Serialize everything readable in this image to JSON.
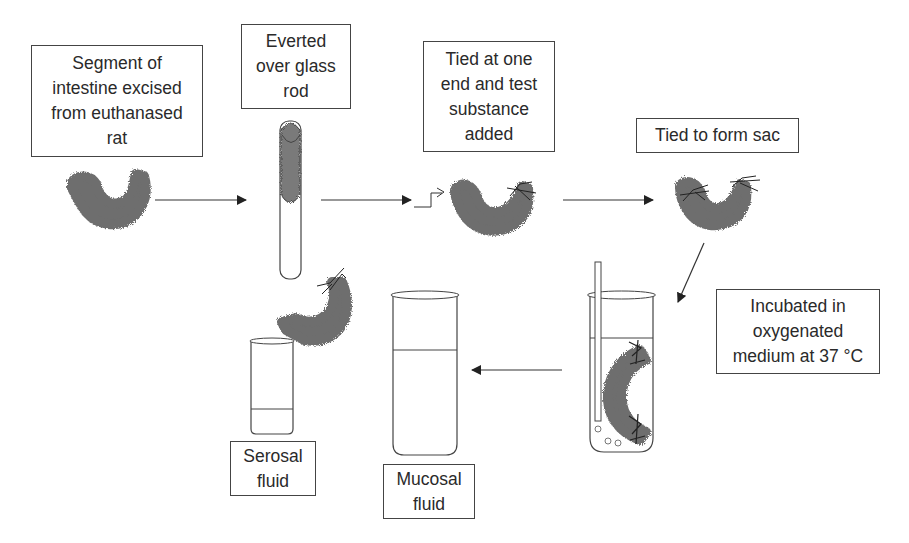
{
  "diagram": {
    "type": "process-flow",
    "steps": [
      {
        "id": "excise",
        "label": "Segment of\nintestine excised\nfrom euthanased\nrat"
      },
      {
        "id": "evert",
        "label": "Everted\nover glass\nrod"
      },
      {
        "id": "tie-one",
        "label": "Tied at one\nend and test\nsubstance\nadded"
      },
      {
        "id": "tie-sac",
        "label": "Tied to form sac"
      },
      {
        "id": "incubate",
        "label": "Incubated in\noxygenated\nmedium at 37 °C"
      }
    ],
    "outputs": [
      {
        "id": "serosal",
        "label": "Serosal\nfluid"
      },
      {
        "id": "mucosal",
        "label": "Mucosal\nfluid"
      }
    ],
    "colors": {
      "line": "#333333",
      "tissue": "#6e6e6e",
      "box_border": "#444444"
    }
  }
}
